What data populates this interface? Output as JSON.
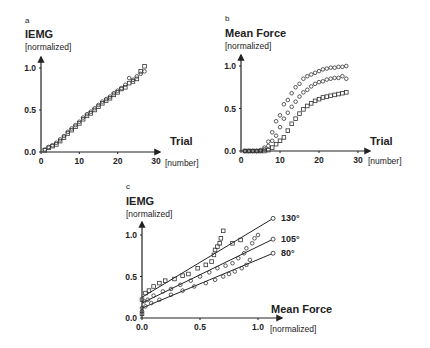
{
  "chart_data": [
    {
      "panel": "a",
      "type": "scatter",
      "title": "",
      "ylabel": "IEMG",
      "yunit": "[normalized]",
      "xlabel": "Trial",
      "xunit": "[number]",
      "xlim": [
        0,
        30
      ],
      "ylim": [
        0,
        1.0
      ],
      "xticks": [
        0,
        10,
        20,
        30
      ],
      "yticks": [
        0.0,
        0.5,
        1.0
      ],
      "ytick_labels": [
        "0.0",
        "0.5",
        "1.0"
      ],
      "grid": false,
      "series": [
        {
          "name": "circles",
          "marker": "circle",
          "x": [
            1,
            2,
            3,
            4,
            5,
            6,
            7,
            8,
            9,
            10,
            11,
            12,
            13,
            14,
            15,
            16,
            17,
            18,
            19,
            20,
            21,
            22,
            23,
            24,
            25,
            26,
            27
          ],
          "y": [
            0.03,
            0.06,
            0.08,
            0.11,
            0.15,
            0.19,
            0.24,
            0.28,
            0.32,
            0.36,
            0.41,
            0.45,
            0.48,
            0.52,
            0.56,
            0.6,
            0.63,
            0.66,
            0.7,
            0.73,
            0.76,
            0.8,
            0.88,
            0.86,
            0.9,
            0.93,
            0.96
          ]
        },
        {
          "name": "squares",
          "marker": "square",
          "x": [
            1,
            2,
            3,
            4,
            5,
            6,
            7,
            8,
            9,
            10,
            11,
            12,
            13,
            14,
            15,
            16,
            17,
            18,
            19,
            20,
            21,
            22,
            23,
            24,
            25,
            26,
            27
          ],
          "y": [
            0.02,
            0.05,
            0.07,
            0.09,
            0.13,
            0.17,
            0.22,
            0.26,
            0.3,
            0.34,
            0.39,
            0.43,
            0.46,
            0.5,
            0.54,
            0.58,
            0.61,
            0.64,
            0.68,
            0.71,
            0.75,
            0.77,
            0.82,
            0.84,
            0.87,
            0.96,
            1.02
          ]
        }
      ]
    },
    {
      "panel": "b",
      "type": "scatter",
      "title": "",
      "ylabel": "Mean Force",
      "yunit": "[normalized]",
      "xlabel": "Trial",
      "xunit": "[number]",
      "xlim": [
        0,
        30
      ],
      "ylim": [
        0,
        1.0
      ],
      "xticks": [
        0,
        10,
        20,
        30
      ],
      "yticks": [
        0.0,
        0.5,
        1.0
      ],
      "ytick_labels": [
        "0.0",
        "0.5",
        "1.0"
      ],
      "grid": false,
      "series": [
        {
          "name": "upper circles",
          "marker": "circle",
          "x": [
            1,
            2,
            3,
            4,
            5,
            6,
            7,
            8,
            9,
            10,
            11,
            12,
            13,
            14,
            15,
            16,
            17,
            18,
            19,
            20,
            21,
            22,
            23,
            24,
            25,
            26,
            27
          ],
          "y": [
            0,
            0,
            0,
            0,
            0.01,
            0.04,
            0.11,
            0.22,
            0.35,
            0.42,
            0.55,
            0.6,
            0.68,
            0.75,
            0.79,
            0.85,
            0.88,
            0.9,
            0.92,
            0.94,
            0.96,
            0.97,
            0.98,
            0.98,
            0.99,
            0.99,
            1.0
          ]
        },
        {
          "name": "middle circles",
          "marker": "circle",
          "x": [
            1,
            2,
            3,
            4,
            5,
            6,
            7,
            8,
            9,
            10,
            11,
            12,
            13,
            14,
            15,
            16,
            17,
            18,
            19,
            20,
            21,
            22,
            23,
            24,
            25,
            26,
            27
          ],
          "y": [
            0,
            0,
            0,
            0,
            0,
            0.02,
            0.06,
            0.12,
            0.18,
            0.28,
            0.38,
            0.45,
            0.52,
            0.58,
            0.64,
            0.69,
            0.72,
            0.76,
            0.79,
            0.81,
            0.82,
            0.84,
            0.85,
            0.86,
            0.86,
            0.88,
            0.85
          ]
        },
        {
          "name": "squares",
          "marker": "square",
          "x": [
            1,
            2,
            3,
            4,
            5,
            6,
            7,
            8,
            9,
            10,
            11,
            12,
            13,
            14,
            15,
            16,
            17,
            18,
            19,
            20,
            21,
            22,
            23,
            24,
            25,
            26,
            27
          ],
          "y": [
            0,
            0,
            0,
            0,
            0,
            0,
            0.01,
            0.04,
            0.08,
            0.12,
            0.16,
            0.24,
            0.32,
            0.38,
            0.44,
            0.49,
            0.53,
            0.56,
            0.59,
            0.61,
            0.63,
            0.64,
            0.65,
            0.66,
            0.67,
            0.68,
            0.69
          ]
        }
      ]
    },
    {
      "panel": "c",
      "type": "scatter",
      "title": "",
      "ylabel": "IEMG",
      "yunit": "[normalized]",
      "xlabel": "Mean Force",
      "xunit": "[normalized]",
      "xlim": [
        0,
        1.15
      ],
      "ylim": [
        0,
        1.2
      ],
      "xticks": [
        0.0,
        0.5,
        1.0
      ],
      "xtick_labels": [
        "0.0",
        "0.5",
        "1.0"
      ],
      "yticks": [
        0.0,
        0.5,
        1.0
      ],
      "ytick_labels": [
        "0.0",
        "0.5",
        "1.0"
      ],
      "grid": false,
      "series": [
        {
          "name": "130°",
          "marker": "square",
          "fit": {
            "x0": 0.0,
            "y0": 0.25,
            "x1": 1.13,
            "y1": 1.2
          },
          "x": [
            0.0,
            0.0,
            0.03,
            0.06,
            0.1,
            0.15,
            0.2,
            0.28,
            0.35,
            0.4,
            0.48,
            0.55,
            0.6,
            0.62,
            0.63,
            0.65,
            0.67,
            0.68,
            0.7,
            0.78,
            0.85
          ],
          "y": [
            0.05,
            0.22,
            0.3,
            0.33,
            0.38,
            0.42,
            0.45,
            0.47,
            0.51,
            0.53,
            0.6,
            0.64,
            0.68,
            0.76,
            0.82,
            0.86,
            0.9,
            0.96,
            1.05,
            0.9,
            0.94
          ]
        },
        {
          "name": "105°",
          "marker": "circle",
          "fit": {
            "x0": 0.0,
            "y0": 0.18,
            "x1": 1.13,
            "y1": 0.95
          },
          "x": [
            0.0,
            0.02,
            0.05,
            0.1,
            0.18,
            0.25,
            0.33,
            0.42,
            0.5,
            0.58,
            0.65,
            0.72,
            0.78,
            0.83,
            0.88,
            0.9,
            0.95,
            0.97,
            1.0
          ],
          "y": [
            0.12,
            0.2,
            0.22,
            0.27,
            0.32,
            0.35,
            0.4,
            0.45,
            0.5,
            0.55,
            0.6,
            0.63,
            0.66,
            0.72,
            0.78,
            0.84,
            0.9,
            0.96,
            1.0
          ]
        },
        {
          "name": "80°",
          "marker": "circle",
          "fit": {
            "x0": 0.0,
            "y0": 0.12,
            "x1": 1.13,
            "y1": 0.78
          },
          "x": [
            0.0,
            0.03,
            0.08,
            0.15,
            0.25,
            0.35,
            0.45,
            0.55,
            0.63,
            0.7,
            0.75,
            0.8,
            0.86,
            0.9,
            0.93
          ],
          "y": [
            0.08,
            0.14,
            0.18,
            0.22,
            0.28,
            0.33,
            0.38,
            0.42,
            0.46,
            0.5,
            0.53,
            0.56,
            0.6,
            0.64,
            0.7
          ]
        }
      ]
    }
  ]
}
